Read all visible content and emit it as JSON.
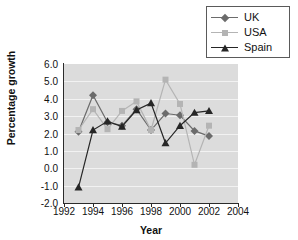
{
  "chart_data": {
    "type": "line",
    "title": "",
    "xlabel": "Year",
    "ylabel": "Percentage growth",
    "x": [
      1993,
      1994,
      1995,
      1996,
      1997,
      1998,
      1999,
      2000,
      2001,
      2002
    ],
    "xlim": [
      1992,
      2004
    ],
    "ylim": [
      -2.0,
      6.0
    ],
    "xticks": [
      "1992",
      "1994",
      "1996",
      "1998",
      "2000",
      "2002",
      "2004"
    ],
    "xtick_values": [
      1992,
      1994,
      1996,
      1998,
      2000,
      2002,
      2004
    ],
    "yticks": [
      "6.0",
      "5.0",
      "4.0",
      "3.0",
      "2.0",
      "1.0",
      "0.0",
      "-1.0",
      "-2.0"
    ],
    "ytick_values": [
      6.0,
      5.0,
      4.0,
      3.0,
      2.0,
      1.0,
      0.0,
      -1.0,
      -2.0
    ],
    "grid": true,
    "grid_axis": "y",
    "legend_position": "top-right",
    "plot_background": "#dcdcdc",
    "series": [
      {
        "name": "UK",
        "marker": "diamond",
        "color": "#6b6b6b",
        "values": [
          2.1,
          4.2,
          2.65,
          2.45,
          3.4,
          2.2,
          3.15,
          3.05,
          2.15,
          1.85
        ]
      },
      {
        "name": "USA",
        "marker": "square",
        "color": "#b4b4b4",
        "values": [
          2.2,
          3.4,
          2.25,
          3.3,
          3.85,
          2.2,
          5.1,
          3.7,
          0.2,
          2.45
        ]
      },
      {
        "name": "Spain",
        "marker": "triangle",
        "color": "#262626",
        "values": [
          -1.1,
          2.2,
          2.7,
          2.4,
          3.35,
          3.75,
          1.45,
          2.45,
          3.2,
          3.3
        ]
      }
    ]
  },
  "legend": {
    "items": [
      {
        "label": "UK"
      },
      {
        "label": "USA"
      },
      {
        "label": "Spain"
      }
    ]
  },
  "axes": {
    "x_title": "Year",
    "y_title": "Percentage growth"
  }
}
